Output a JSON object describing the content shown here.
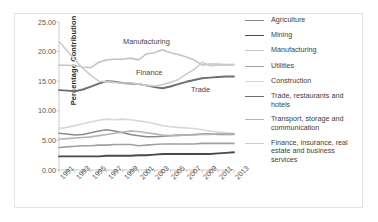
{
  "chart_data": {
    "type": "line",
    "title": "",
    "xlabel": "",
    "ylabel": "Percentage Contribution",
    "ylim": [
      0,
      25
    ],
    "yticks": [
      "0.00",
      "5.00",
      "10.00",
      "15.00",
      "20.00",
      "25.00"
    ],
    "ytick_values": [
      0,
      5,
      10,
      15,
      20,
      25
    ],
    "grid": false,
    "legend_position": "right",
    "x": [
      1991,
      1992,
      1993,
      1994,
      1995,
      1996,
      1997,
      1998,
      1999,
      2000,
      2001,
      2002,
      2003,
      2004,
      2005,
      2006,
      2007,
      2008,
      2009,
      2010,
      2011,
      2012,
      2013
    ],
    "xtick_labels": [
      "1991",
      "1993",
      "1995",
      "1997",
      "1999",
      "2001",
      "2003",
      "2005",
      "2007",
      "2009",
      "2011",
      "2013"
    ],
    "xtick_values": [
      1991,
      1993,
      1995,
      1997,
      1999,
      2001,
      2003,
      2005,
      2007,
      2009,
      2011,
      2013
    ],
    "series": [
      {
        "name": "Agriculture",
        "color": "#8c8c8c",
        "width": 1.5,
        "values": [
          6.2,
          6.1,
          5.9,
          6.0,
          6.3,
          6.6,
          6.8,
          6.6,
          6.3,
          6.0,
          5.8,
          5.6,
          5.6,
          5.7,
          5.8,
          5.9,
          5.9,
          6.0,
          6.1,
          6.1,
          6.0,
          6.0,
          6.0
        ]
      },
      {
        "name": "Mining",
        "color": "#4a4a4a",
        "width": 1.9,
        "values": [
          2.3,
          2.3,
          2.3,
          2.3,
          2.3,
          2.3,
          2.4,
          2.4,
          2.4,
          2.4,
          2.5,
          2.5,
          2.6,
          2.7,
          2.7,
          2.7,
          2.7,
          2.7,
          2.7,
          2.7,
          2.8,
          2.9,
          3.0
        ]
      },
      {
        "name": "Manufacturing",
        "color": "#c4c4c4",
        "width": 1.6,
        "values": [
          17.7,
          17.7,
          17.6,
          17.4,
          17.3,
          18.2,
          18.6,
          18.7,
          18.7,
          18.9,
          18.6,
          19.6,
          19.8,
          20.3,
          19.8,
          19.5,
          19.1,
          18.6,
          17.7,
          17.9,
          17.9,
          17.8,
          17.8
        ]
      },
      {
        "name": "Utilities",
        "color": "#a0a0a0",
        "width": 1.6,
        "values": [
          3.8,
          3.9,
          4.0,
          4.1,
          4.1,
          4.2,
          4.2,
          4.3,
          4.3,
          4.3,
          4.1,
          4.2,
          4.3,
          4.4,
          4.4,
          4.4,
          4.4,
          4.4,
          4.5,
          4.5,
          4.5,
          4.5,
          4.5
        ]
      },
      {
        "name": "Construction",
        "color": "#d8d8d8",
        "width": 1.6,
        "values": [
          7.0,
          7.2,
          7.5,
          7.8,
          8.1,
          8.4,
          8.6,
          8.5,
          8.6,
          8.5,
          8.3,
          8.1,
          7.8,
          7.5,
          7.3,
          7.2,
          7.1,
          7.0,
          6.8,
          6.6,
          6.4,
          6.3,
          6.2
        ]
      },
      {
        "name": "Trade, restaurants and hotels",
        "color": "#6e6e6e",
        "width": 1.9,
        "values": [
          13.5,
          13.4,
          13.3,
          13.6,
          14.1,
          14.6,
          15.0,
          14.9,
          14.7,
          14.6,
          14.5,
          14.3,
          14.0,
          13.8,
          14.1,
          14.5,
          14.9,
          15.2,
          15.5,
          15.6,
          15.7,
          15.8,
          15.8
        ]
      },
      {
        "name": "Transport, storage and communication",
        "color": "#b5b5b5",
        "width": 1.6,
        "values": [
          5.2,
          5.3,
          5.4,
          5.5,
          5.6,
          5.8,
          6.0,
          6.2,
          6.4,
          6.6,
          6.5,
          6.3,
          6.1,
          5.9,
          5.8,
          5.8,
          5.9,
          5.9,
          6.0,
          6.0,
          6.1,
          6.1,
          6.1
        ]
      },
      {
        "name": "Finance, insurance, real estate and business services",
        "color": "#cccccc",
        "width": 1.6,
        "values": [
          21.7,
          20.2,
          18.6,
          17.2,
          16.0,
          15.0,
          14.9,
          14.8,
          14.7,
          14.7,
          14.5,
          14.3,
          14.2,
          14.4,
          14.8,
          15.3,
          16.2,
          17.0,
          18.2,
          17.6,
          17.7,
          17.7,
          17.8
        ]
      }
    ],
    "annotations": [
      {
        "text": "Manufacturing",
        "x_px": 64,
        "y_px": 15
      },
      {
        "text": "Finance",
        "x_px": 77,
        "y_px": 46
      },
      {
        "text": "Trade",
        "x_px": 132,
        "y_px": 63
      }
    ]
  }
}
